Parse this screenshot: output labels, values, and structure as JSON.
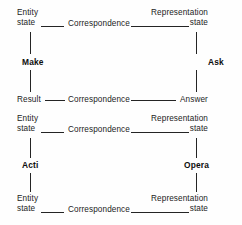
{
  "diagram": {
    "background_color": "#fefefe",
    "line_color": "#242424",
    "text_color": "#1c1c1c",
    "nodes": {
      "entity_state_1": {
        "line1": "Entity",
        "line2": "state"
      },
      "representation_state_1": {
        "line1": "Representation",
        "line2": "state"
      },
      "result": {
        "line1": "Result"
      },
      "answer": {
        "line1": "Answer"
      },
      "entity_state_2": {
        "line1": "Entity",
        "line2": "state"
      },
      "representation_state_2": {
        "line1": "Representation",
        "line2": "state"
      },
      "entity_state_3": {
        "line1": "Entity",
        "line2": "state"
      },
      "representation_state_3": {
        "line1": "Representation",
        "line2": "state"
      }
    },
    "edge_labels": {
      "correspondence_1": "Correspondence",
      "correspondence_2": "Correspondence",
      "correspondence_3": "Correspondence",
      "correspondence_4": "Correspondence"
    },
    "verbs": {
      "make": "Make",
      "ask": "Ask",
      "action": "Acti",
      "operation": "Opera"
    }
  }
}
